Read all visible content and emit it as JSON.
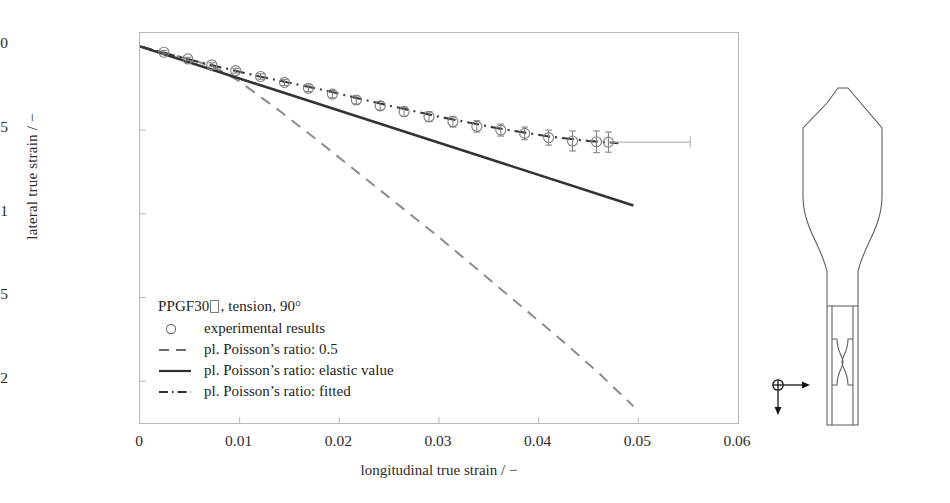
{
  "figure": {
    "name": "lateral-vs-longitudinal-true-strain"
  },
  "chart_data": {
    "type": "scatter",
    "title": "",
    "xlabel": "longitudinal true strain / −",
    "ylabel": "lateral true strain / −",
    "xlim": [
      0,
      0.06
    ],
    "ylim": [
      -0.0225,
      0.0008
    ],
    "xticks": [
      0,
      0.01,
      0.02,
      0.03,
      0.04,
      0.05,
      0.06
    ],
    "xticklabels": [
      "0",
      "0.01",
      "0.02",
      "0.03",
      "0.04",
      "0.05",
      "0.06"
    ],
    "yticks": [
      0,
      -0.005,
      -0.01,
      -0.015,
      -0.02
    ],
    "yticklabels": [
      "0",
      "−0.005",
      "−0.01",
      "−0.015",
      "−0.02"
    ],
    "grid": false,
    "legend_position": "inside-lower-left",
    "series": [
      {
        "name": "experimental results",
        "style": "circles-with-errorbars",
        "marker": "open-circle",
        "color": "#808080",
        "x": [
          0.0024,
          0.0048,
          0.0072,
          0.0096,
          0.0121,
          0.0145,
          0.0169,
          0.0193,
          0.0217,
          0.0241,
          0.0265,
          0.029,
          0.0314,
          0.0338,
          0.0362,
          0.0386,
          0.041,
          0.0434,
          0.0458,
          0.047
        ],
        "y": [
          -0.00035,
          -0.00075,
          -0.0011,
          -0.00145,
          -0.0018,
          -0.00215,
          -0.0025,
          -0.00285,
          -0.0032,
          -0.00355,
          -0.0039,
          -0.0042,
          -0.0045,
          -0.00478,
          -0.005,
          -0.0052,
          -0.00545,
          -0.00565,
          -0.0057,
          -0.00572
        ],
        "yerr": [
          0.0001,
          0.0001,
          0.00012,
          0.00014,
          0.00016,
          0.00018,
          0.0002,
          0.00022,
          0.00024,
          0.00026,
          0.00028,
          0.0003,
          0.00032,
          0.00034,
          0.00036,
          0.00038,
          0.00045,
          0.0006,
          0.00065,
          0.0006
        ],
        "xerr_last": 0.0082
      },
      {
        "name": "pl. Poisson's ratio: 0.5",
        "style": "dashed",
        "color": "#8c8c8c",
        "x": [
          0.0,
          0.004,
          0.006,
          0.008,
          0.01,
          0.014,
          0.018,
          0.022,
          0.026,
          0.03,
          0.034,
          0.038,
          0.042,
          0.046,
          0.0495
        ],
        "y": [
          0.0,
          -0.00062,
          -0.00095,
          -0.0014,
          -0.0021,
          -0.00385,
          -0.0057,
          -0.0076,
          -0.0095,
          -0.0114,
          -0.0134,
          -0.0154,
          -0.0174,
          -0.0195,
          -0.0215
        ]
      },
      {
        "name": "pl. Poisson's ratio: elastic value",
        "style": "solid",
        "color": "#333333",
        "x": [
          0.0,
          0.0495
        ],
        "y": [
          0.0,
          -0.0095
        ]
      },
      {
        "name": "pl. Poisson's ratio: fitted",
        "style": "dash-dot",
        "color": "#3a3a3a",
        "x": [
          0.0,
          0.006,
          0.012,
          0.018,
          0.024,
          0.03,
          0.036,
          0.041,
          0.045,
          0.048
        ],
        "y": [
          0.0,
          -0.00095,
          -0.0018,
          -0.00255,
          -0.0034,
          -0.0042,
          -0.0049,
          -0.00538,
          -0.00565,
          -0.00578
        ]
      }
    ]
  },
  "legend": {
    "title_prefix": "PPGF30",
    "title_suffix": ", tension, 90°",
    "entries": [
      {
        "key": "open-circle",
        "label": "experimental results"
      },
      {
        "key": "dashed-line",
        "label": "pl. Poisson’s ratio: 0.5"
      },
      {
        "key": "solid-line",
        "label": "pl. Poisson’s ratio: elastic value"
      },
      {
        "key": "dash-dot-line",
        "label": "pl. Poisson’s ratio: fitted"
      }
    ]
  },
  "specimen": {
    "angle_label": "90°",
    "axis_1_label": "1",
    "axis_2_label": "2"
  },
  "colors": {
    "frame": "#b9b9b9",
    "text": "#1d1d1d",
    "marker": "#808080",
    "solid": "#333333",
    "dashed": "#8c8c8c",
    "dashdot": "#3a3a3a"
  }
}
